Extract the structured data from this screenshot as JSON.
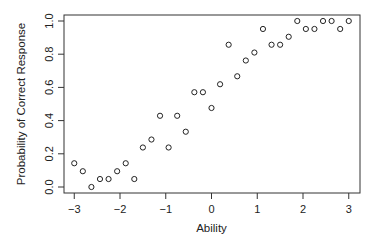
{
  "chart_data": {
    "type": "scatter",
    "title": "",
    "xlabel": "Ability",
    "ylabel": "Probability of Correct Response",
    "xlim": [
      -3.2,
      3.25
    ],
    "ylim": [
      -0.03,
      1.03
    ],
    "grid": false,
    "legend": null,
    "marker": "open-circle",
    "xticks": [
      -3,
      -2,
      -1,
      0,
      1,
      2,
      3
    ],
    "xtick_labels": [
      "−3",
      "−2",
      "−1",
      "0",
      "1",
      "2",
      "3"
    ],
    "yticks": [
      0.0,
      0.2,
      0.4,
      0.6,
      0.8,
      1.0
    ],
    "ytick_labels": [
      "0.0",
      "0.2",
      "0.4",
      "0.6",
      "0.8",
      "1.0"
    ],
    "x": [
      -3.0,
      -2.8125,
      -2.625,
      -2.4375,
      -2.25,
      -2.0625,
      -1.875,
      -1.6875,
      -1.5,
      -1.3125,
      -1.125,
      -0.9375,
      -0.75,
      -0.5625,
      -0.375,
      -0.1875,
      0.0,
      0.1875,
      0.375,
      0.5625,
      0.75,
      0.9375,
      1.125,
      1.3125,
      1.5,
      1.6875,
      1.875,
      2.0625,
      2.25,
      2.4375,
      2.625,
      2.8125,
      3.0
    ],
    "y": [
      0.143,
      0.095,
      0.0,
      0.048,
      0.048,
      0.095,
      0.143,
      0.048,
      0.238,
      0.286,
      0.429,
      0.238,
      0.429,
      0.333,
      0.571,
      0.571,
      0.476,
      0.619,
      0.857,
      0.667,
      0.762,
      0.81,
      0.952,
      0.857,
      0.857,
      0.905,
      1.0,
      0.952,
      0.952,
      1.0,
      1.0,
      0.952,
      1.0
    ]
  },
  "layout": {
    "plot_left": 64,
    "plot_right": 360,
    "plot_top": 15,
    "plot_bottom": 193,
    "x0_px": 211.5,
    "x_px_per_unit": 45.75,
    "y0_px": 187,
    "y_px_per_unit": 166
  }
}
